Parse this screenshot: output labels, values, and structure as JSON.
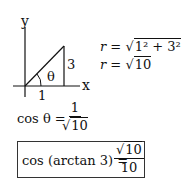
{
  "diagram": {
    "axis_y_label": "y",
    "axis_x_label": "x",
    "angle_label": "θ",
    "side_opposite": "3",
    "side_adjacent": "1"
  },
  "equations": {
    "r_line1_lhs": "r =",
    "r_line1_rhs": "1² + 3²",
    "r_line2_lhs": "r =",
    "r_line2_rhs": "10",
    "cos_lhs": "cos θ =",
    "cos_num": "1",
    "cos_den": "10",
    "result_lhs": "cos (arctan 3) =",
    "result_num": "10",
    "result_den": "10"
  }
}
